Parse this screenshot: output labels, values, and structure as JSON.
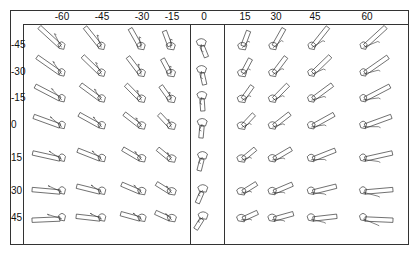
{
  "figure": {
    "column_axis": {
      "labels": [
        "-60",
        "-45",
        "-30",
        "-15",
        "0",
        "15",
        "30",
        "45",
        "60"
      ],
      "x_positions": [
        62,
        102,
        142,
        172,
        204,
        245,
        276,
        315,
        367
      ]
    },
    "row_axis": {
      "labels": [
        "-45",
        "-30",
        "-15",
        "0",
        "15",
        "30",
        "45"
      ],
      "y_positions": [
        44,
        71,
        97,
        124,
        157,
        190,
        217
      ]
    },
    "divider_x": [
      190,
      224
    ],
    "glyph_description": "line-drawn 3D object (wing/fuselage-like shape) rendered at each column-angle × row-angle combination",
    "stroke_color": "#333333"
  }
}
